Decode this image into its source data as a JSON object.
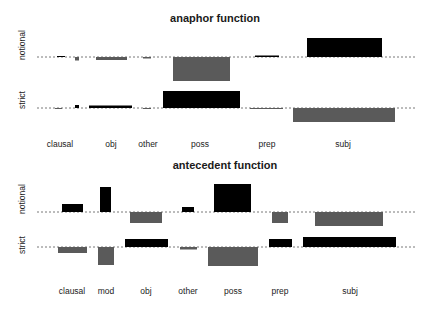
{
  "chart_data": [
    {
      "type": "bar",
      "subtype": "association-plot",
      "title": "anaphor function",
      "rows": [
        "notional",
        "strict"
      ],
      "categories": [
        "clausal",
        "obj",
        "other",
        "poss",
        "prep",
        "subj"
      ],
      "positive_color": "#000000",
      "negative_color": "#5a5a5a",
      "layout": {
        "title_xy": [
          215,
          19
        ],
        "row_baselines": {
          "notional": 57,
          "strict": 108
        },
        "row_label_y": {
          "notional": 45,
          "strict": 100
        },
        "baseline_x": [
          37,
          415
        ],
        "tick_y": 147,
        "tick_x": {
          "clausal": 60,
          "obj": 111,
          "other": 148,
          "poss": 200,
          "prep": 267,
          "subj": 343
        }
      },
      "bars": [
        {
          "row": "notional",
          "category": "clausal",
          "x0": 57,
          "x1": 65,
          "residual": 0.1
        },
        {
          "row": "notional",
          "category": "clausal",
          "x0": 75,
          "x1": 79,
          "residual": -0.7
        },
        {
          "row": "notional",
          "category": "obj",
          "x0": 96,
          "x1": 127,
          "residual": -0.6
        },
        {
          "row": "notional",
          "category": "other",
          "x0": 143,
          "x1": 151,
          "residual": -0.3
        },
        {
          "row": "notional",
          "category": "poss",
          "x0": 173,
          "x1": 230,
          "residual": -4.8
        },
        {
          "row": "notional",
          "category": "prep",
          "x0": 255,
          "x1": 279,
          "residual": 0.3
        },
        {
          "row": "notional",
          "category": "subj",
          "x0": 307,
          "x1": 382,
          "residual": 3.8
        },
        {
          "row": "strict",
          "category": "clausal",
          "x0": 55,
          "x1": 62,
          "residual": -0.1
        },
        {
          "row": "strict",
          "category": "clausal",
          "x0": 75,
          "x1": 79,
          "residual": 0.6
        },
        {
          "row": "strict",
          "category": "obj",
          "x0": 89,
          "x1": 132,
          "residual": 0.5
        },
        {
          "row": "strict",
          "category": "other",
          "x0": 143,
          "x1": 151,
          "residual": -0.2
        },
        {
          "row": "strict",
          "category": "poss",
          "x0": 163,
          "x1": 240,
          "residual": 3.4
        },
        {
          "row": "strict",
          "category": "prep",
          "x0": 250,
          "x1": 283,
          "residual": -0.2
        },
        {
          "row": "strict",
          "category": "subj",
          "x0": 293,
          "x1": 395,
          "residual": -2.8
        }
      ]
    },
    {
      "type": "bar",
      "subtype": "association-plot",
      "title": "antecedent function",
      "rows": [
        "notional",
        "strict"
      ],
      "categories": [
        "clausal",
        "mod",
        "obj",
        "other",
        "poss",
        "prep",
        "subj"
      ],
      "positive_color": "#000000",
      "negative_color": "#5a5a5a",
      "layout": {
        "title_xy": [
          225,
          166
        ],
        "row_baselines": {
          "notional": 212,
          "strict": 247
        },
        "row_label_y": {
          "notional": 199,
          "strict": 245
        },
        "baseline_x": [
          37,
          415
        ],
        "tick_y": 294,
        "tick_x": {
          "clausal": 72,
          "mod": 106,
          "obj": 146,
          "other": 188,
          "poss": 233,
          "prep": 280,
          "subj": 350
        }
      },
      "bars": [
        {
          "row": "notional",
          "category": "clausal",
          "x0": 62,
          "x1": 83,
          "residual": 1.6
        },
        {
          "row": "notional",
          "category": "mod",
          "x0": 100,
          "x1": 111,
          "residual": 5.0
        },
        {
          "row": "notional",
          "category": "obj",
          "x0": 130,
          "x1": 162,
          "residual": -2.2
        },
        {
          "row": "notional",
          "category": "other",
          "x0": 182,
          "x1": 194,
          "residual": 1.0
        },
        {
          "row": "notional",
          "category": "poss",
          "x0": 214,
          "x1": 251,
          "residual": 5.6
        },
        {
          "row": "notional",
          "category": "prep",
          "x0": 272,
          "x1": 288,
          "residual": -2.2
        },
        {
          "row": "notional",
          "category": "subj",
          "x0": 315,
          "x1": 383,
          "residual": -2.8
        },
        {
          "row": "strict",
          "category": "clausal",
          "x0": 58,
          "x1": 87,
          "residual": -1.2
        },
        {
          "row": "strict",
          "category": "mod",
          "x0": 98,
          "x1": 114,
          "residual": -3.6
        },
        {
          "row": "strict",
          "category": "obj",
          "x0": 125,
          "x1": 168,
          "residual": 1.6
        },
        {
          "row": "strict",
          "category": "other",
          "x0": 180,
          "x1": 197,
          "residual": -0.5
        },
        {
          "row": "strict",
          "category": "poss",
          "x0": 208,
          "x1": 258,
          "residual": -3.8
        },
        {
          "row": "strict",
          "category": "prep",
          "x0": 269,
          "x1": 292,
          "residual": 1.6
        },
        {
          "row": "strict",
          "category": "subj",
          "x0": 303,
          "x1": 396,
          "residual": 2.0
        }
      ]
    }
  ],
  "scale_px_per_unit": 5
}
